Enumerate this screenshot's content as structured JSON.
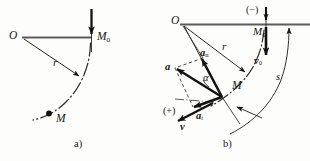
{
  "figure": {
    "type": "mechanics-diagram",
    "background_color": "#fdfdfb",
    "line_color": "#161616",
    "panels": [
      {
        "id": "a",
        "caption": "a)",
        "labels": {
          "center": "O",
          "radius": "r",
          "initial_point": "M",
          "initial_point_sub": "0",
          "current_point": "M"
        }
      },
      {
        "id": "b",
        "caption": "b)",
        "labels": {
          "center": "O",
          "radius": "r",
          "initial_point": "M",
          "initial_point_sub": "0",
          "current_point": "M",
          "arc_length": "s",
          "angle": "α",
          "sign_negative": "(−)",
          "sign_positive": "(+)",
          "initial_velocity": "v",
          "initial_velocity_sub": "0",
          "velocity": "v",
          "acceleration": "a",
          "normal_acceleration": "a",
          "normal_acceleration_sub": "n",
          "tangential_acceleration": "a",
          "tangential_acceleration_sub": "t"
        }
      }
    ]
  }
}
